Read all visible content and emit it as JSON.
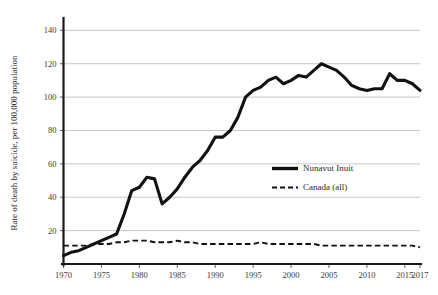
{
  "chart_data": {
    "type": "line",
    "title": "",
    "subtitle": "",
    "xlabel": "",
    "ylabel": "Rate of death by suicide, per 100,000 population",
    "xlim": [
      1970,
      2017
    ],
    "ylim": [
      0,
      145
    ],
    "grid": "horizontal",
    "legend_position": "center-right",
    "y_ticks": [
      20,
      40,
      60,
      80,
      100,
      120,
      140
    ],
    "y_tick_labels": [
      "20",
      "40",
      "60",
      "80",
      "100",
      "120",
      "140"
    ],
    "x_ticks": [
      1970,
      1975,
      1980,
      1985,
      1990,
      1995,
      2000,
      2005,
      2010,
      2015,
      2017
    ],
    "x_tick_labels": [
      "1970",
      "1975",
      "1980",
      "1985",
      "1990",
      "1995",
      "2000",
      "2005",
      "2010",
      "2015",
      "2017"
    ],
    "x": [
      1970,
      1971,
      1972,
      1973,
      1974,
      1975,
      1976,
      1977,
      1978,
      1979,
      1980,
      1981,
      1982,
      1983,
      1984,
      1985,
      1986,
      1987,
      1988,
      1989,
      1990,
      1991,
      1992,
      1993,
      1994,
      1995,
      1996,
      1997,
      1998,
      1999,
      2000,
      2001,
      2002,
      2003,
      2004,
      2005,
      2006,
      2007,
      2008,
      2009,
      2010,
      2011,
      2012,
      2013,
      2014,
      2015,
      2016,
      2017
    ],
    "series": [
      {
        "name": "Nunavut Inuit",
        "style": "solid",
        "color": "#111111",
        "values": [
          5,
          7,
          8,
          10,
          12,
          14,
          16,
          18,
          30,
          44,
          46,
          52,
          51,
          36,
          40,
          45,
          52,
          58,
          62,
          68,
          76,
          76,
          80,
          88,
          100,
          104,
          106,
          110,
          112,
          108,
          110,
          113,
          112,
          116,
          120,
          118,
          116,
          112,
          107,
          105,
          104,
          105,
          105,
          114,
          110,
          110,
          108,
          104
        ]
      },
      {
        "name": "Canada (all)",
        "style": "dashed",
        "color": "#111111",
        "values": [
          11,
          11,
          11,
          11,
          12,
          12,
          12,
          13,
          13,
          14,
          14,
          14,
          13,
          13,
          13,
          14,
          13,
          13,
          12,
          12,
          12,
          12,
          12,
          12,
          12,
          12,
          13,
          12,
          12,
          12,
          12,
          12,
          12,
          12,
          11,
          11,
          11,
          11,
          11,
          11,
          11,
          11,
          11,
          11,
          11,
          11,
          11,
          10
        ]
      }
    ],
    "legend_entries": [
      {
        "label": "Nunavut Inuit",
        "style": "solid"
      },
      {
        "label": "Canada (all)",
        "style": "dashed"
      }
    ]
  }
}
